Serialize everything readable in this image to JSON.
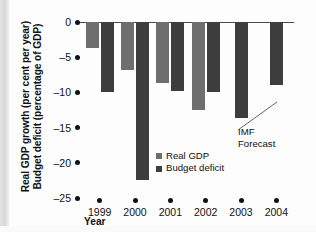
{
  "chart_data": {
    "type": "bar",
    "title": "",
    "subtitle": "",
    "xlabel": "Year",
    "ylabel_line1": "Real GDP growth (per cent per year)",
    "ylabel_line2": "Budget deficit (percentage of GDP)",
    "categories": [
      "1999",
      "2000",
      "2001",
      "2002",
      "2003",
      "2004"
    ],
    "series": [
      {
        "name": "Real GDP",
        "color": "#6e6e6e",
        "values": [
          -3.7,
          -6.8,
          -8.6,
          -12.5,
          null,
          null
        ]
      },
      {
        "name": "Budget deficit",
        "color": "#3d3d3d",
        "values": [
          -10.0,
          -22.5,
          -9.8,
          -10.0,
          -13.7,
          -9.0
        ]
      }
    ],
    "ylim": [
      -25,
      0
    ],
    "yticks": [
      "0",
      "–5",
      "–10",
      "–15",
      "–20",
      "–25"
    ],
    "ytick_values": [
      0,
      -5,
      -10,
      -15,
      -20,
      -25
    ],
    "grid": false,
    "legend_position": "inside-center",
    "annotations": [
      {
        "text_line1": "IMF",
        "text_line2": "Forecast",
        "points_to": "2004 Budget deficit bar"
      }
    ]
  },
  "legend": {
    "items": [
      {
        "label": "Real GDP",
        "color": "#6e6e6e"
      },
      {
        "label": "Budget deficit",
        "color": "#3d3d3d"
      }
    ]
  }
}
